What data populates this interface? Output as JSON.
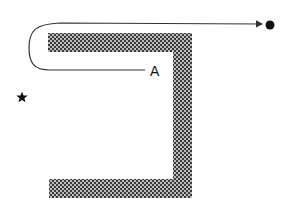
{
  "diagram": {
    "label_a": "A",
    "colors": {
      "background": "#ffffff",
      "line": "#333333",
      "wall_dark": "#3a3a3a",
      "wall_light": "#bdbdbd",
      "marker": "#111111"
    },
    "elements": {
      "wall": {
        "shape": "bracket",
        "description": "hatched U-shaped wall opening to the left"
      },
      "path": {
        "from": "A",
        "to": "goal-dot",
        "description": "curved trajectory looping left around the wall top and ending in arrow"
      },
      "start_marker": "star-icon",
      "goal_marker": "filled-circle"
    }
  }
}
